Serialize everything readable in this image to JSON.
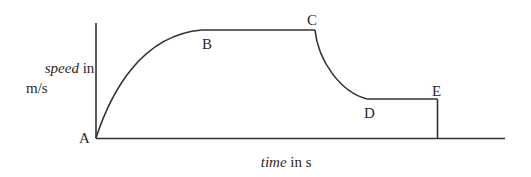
{
  "diagram": {
    "type": "speed-time graph",
    "y_axis_label": {
      "italic": "speed",
      "rest": " in",
      "unit": "m/s"
    },
    "x_axis_label": {
      "italic": "time",
      "rest": " in s"
    },
    "points": [
      {
        "id": "A",
        "label": "A"
      },
      {
        "id": "B",
        "label": "B"
      },
      {
        "id": "C",
        "label": "C"
      },
      {
        "id": "D",
        "label": "D"
      },
      {
        "id": "E",
        "label": "E"
      }
    ],
    "segments": [
      {
        "from": "A",
        "to": "B",
        "shape": "concave curve, increasing speed"
      },
      {
        "from": "B",
        "to": "C",
        "shape": "horizontal, constant speed"
      },
      {
        "from": "C",
        "to": "D",
        "shape": "curve, decreasing speed"
      },
      {
        "from": "D",
        "to": "E",
        "shape": "horizontal, constant lower speed"
      },
      {
        "from": "E",
        "to": "axis",
        "shape": "vertical drop to zero"
      }
    ],
    "line_color": "#333333"
  }
}
